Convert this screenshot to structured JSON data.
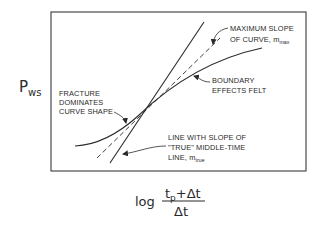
{
  "diagram": {
    "type": "pressure-buildup-semilog-plot",
    "y_axis": {
      "label_main": "P",
      "label_sub": "ws"
    },
    "x_axis": {
      "prefix": "log",
      "numerator_main": "t",
      "numerator_sub": "p",
      "numerator_rest": "+Δt",
      "denominator": "Δt"
    },
    "annotations": {
      "max_slope": {
        "line1": "MAXIMUM SLOPE",
        "line2_main": "OF CURVE, m",
        "line2_sub": "max"
      },
      "boundary": {
        "line1": "BOUNDARY",
        "line2": "EFFECTS FELT"
      },
      "fracture": {
        "line1": "FRACTURE",
        "line2": "DOMINATES",
        "line3": "CURVE SHAPE"
      },
      "true_line": {
        "line1": "LINE WITH SLOPE OF",
        "line2": "\"TRUE\" MIDDLE-TIME",
        "line3_main": "LINE, m",
        "line3_sub": "true"
      }
    },
    "elements": {
      "plot_frame": "rectangle",
      "solid_line": "true middle-time line (steep)",
      "dashed_line": "maximum slope of curve",
      "curve": "measured pressure response"
    },
    "colors": {
      "ink": "#2a2a2a",
      "background": "#ffffff"
    }
  }
}
